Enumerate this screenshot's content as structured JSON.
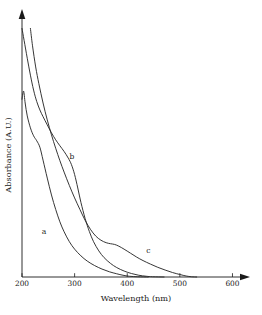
{
  "chart_data": {
    "type": "line",
    "title": "",
    "xlabel": "Wavelength (nm)",
    "ylabel": "Absorbance (A.U.)",
    "xlim": [
      200,
      620
    ],
    "ylim": [
      0,
      1.05
    ],
    "xticks": [
      200,
      300,
      400,
      500,
      600
    ],
    "xticklabels": [
      "200",
      "300",
      "400",
      "500",
      "600"
    ],
    "yticks": [],
    "yticklabels": [],
    "grid": false,
    "legend": "inline-curve-labels",
    "axis_style": "arrow-ended-open-axes",
    "annotations": [
      {
        "text": "a",
        "x": 242,
        "y": 0.175
      },
      {
        "text": "b",
        "x": 295,
        "y": 0.475
      },
      {
        "text": "c",
        "x": 440,
        "y": 0.095
      }
    ],
    "series": [
      {
        "name": "a",
        "label": "a",
        "color": "#2b2b2b",
        "points": [
          {
            "x": 200,
            "y": 0.715
          },
          {
            "x": 203,
            "y": 0.748
          },
          {
            "x": 206,
            "y": 0.7
          },
          {
            "x": 210,
            "y": 0.648
          },
          {
            "x": 216,
            "y": 0.6
          },
          {
            "x": 222,
            "y": 0.568
          },
          {
            "x": 228,
            "y": 0.548
          },
          {
            "x": 234,
            "y": 0.522
          },
          {
            "x": 240,
            "y": 0.47
          },
          {
            "x": 248,
            "y": 0.398
          },
          {
            "x": 256,
            "y": 0.33
          },
          {
            "x": 264,
            "y": 0.272
          },
          {
            "x": 272,
            "y": 0.222
          },
          {
            "x": 280,
            "y": 0.182
          },
          {
            "x": 290,
            "y": 0.142
          },
          {
            "x": 300,
            "y": 0.112
          },
          {
            "x": 312,
            "y": 0.085
          },
          {
            "x": 324,
            "y": 0.064
          },
          {
            "x": 338,
            "y": 0.046
          },
          {
            "x": 352,
            "y": 0.032
          },
          {
            "x": 366,
            "y": 0.021
          },
          {
            "x": 380,
            "y": 0.013
          },
          {
            "x": 392,
            "y": 0.007
          },
          {
            "x": 404,
            "y": 0.003
          },
          {
            "x": 420,
            "y": 0.001
          },
          {
            "x": 440,
            "y": 0.0
          }
        ]
      },
      {
        "name": "b",
        "label": "b",
        "color": "#2b2b2b",
        "points": [
          {
            "x": 200,
            "y": 1.0
          },
          {
            "x": 204,
            "y": 0.952
          },
          {
            "x": 210,
            "y": 0.88
          },
          {
            "x": 216,
            "y": 0.812
          },
          {
            "x": 222,
            "y": 0.752
          },
          {
            "x": 228,
            "y": 0.706
          },
          {
            "x": 234,
            "y": 0.672
          },
          {
            "x": 240,
            "y": 0.645
          },
          {
            "x": 248,
            "y": 0.612
          },
          {
            "x": 256,
            "y": 0.58
          },
          {
            "x": 264,
            "y": 0.552
          },
          {
            "x": 272,
            "y": 0.528
          },
          {
            "x": 280,
            "y": 0.505
          },
          {
            "x": 288,
            "y": 0.478
          },
          {
            "x": 294,
            "y": 0.452
          },
          {
            "x": 300,
            "y": 0.412
          },
          {
            "x": 306,
            "y": 0.358
          },
          {
            "x": 312,
            "y": 0.3
          },
          {
            "x": 320,
            "y": 0.235
          },
          {
            "x": 328,
            "y": 0.183
          },
          {
            "x": 336,
            "y": 0.142
          },
          {
            "x": 346,
            "y": 0.105
          },
          {
            "x": 356,
            "y": 0.078
          },
          {
            "x": 368,
            "y": 0.055
          },
          {
            "x": 380,
            "y": 0.038
          },
          {
            "x": 394,
            "y": 0.024
          },
          {
            "x": 408,
            "y": 0.014
          },
          {
            "x": 422,
            "y": 0.007
          },
          {
            "x": 436,
            "y": 0.003
          },
          {
            "x": 448,
            "y": 0.001
          },
          {
            "x": 470,
            "y": 0.0
          }
        ]
      },
      {
        "name": "c",
        "label": "c",
        "color": "#2b2b2b",
        "points": [
          {
            "x": 216,
            "y": 1.0
          },
          {
            "x": 220,
            "y": 0.93
          },
          {
            "x": 226,
            "y": 0.845
          },
          {
            "x": 232,
            "y": 0.778
          },
          {
            "x": 240,
            "y": 0.7
          },
          {
            "x": 248,
            "y": 0.632
          },
          {
            "x": 256,
            "y": 0.572
          },
          {
            "x": 264,
            "y": 0.518
          },
          {
            "x": 272,
            "y": 0.468
          },
          {
            "x": 280,
            "y": 0.422
          },
          {
            "x": 290,
            "y": 0.368
          },
          {
            "x": 300,
            "y": 0.318
          },
          {
            "x": 310,
            "y": 0.272
          },
          {
            "x": 320,
            "y": 0.228
          },
          {
            "x": 330,
            "y": 0.192
          },
          {
            "x": 340,
            "y": 0.165
          },
          {
            "x": 350,
            "y": 0.148
          },
          {
            "x": 360,
            "y": 0.138
          },
          {
            "x": 368,
            "y": 0.134
          },
          {
            "x": 376,
            "y": 0.131
          },
          {
            "x": 384,
            "y": 0.124
          },
          {
            "x": 394,
            "y": 0.112
          },
          {
            "x": 406,
            "y": 0.096
          },
          {
            "x": 418,
            "y": 0.08
          },
          {
            "x": 430,
            "y": 0.066
          },
          {
            "x": 444,
            "y": 0.052
          },
          {
            "x": 458,
            "y": 0.039
          },
          {
            "x": 472,
            "y": 0.028
          },
          {
            "x": 486,
            "y": 0.018
          },
          {
            "x": 500,
            "y": 0.01
          },
          {
            "x": 512,
            "y": 0.004
          },
          {
            "x": 522,
            "y": 0.001
          },
          {
            "x": 532,
            "y": 0.0
          }
        ]
      }
    ]
  }
}
